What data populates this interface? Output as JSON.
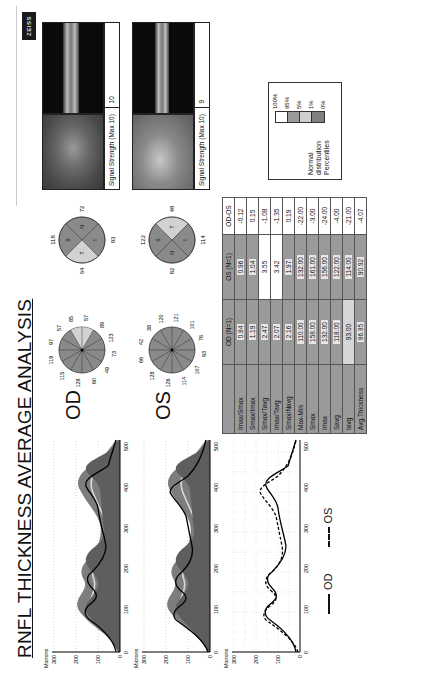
{
  "report": {
    "title": "RNFL THICKNESS AVERAGE ANALYSIS",
    "logo": "ZEISS"
  },
  "graphs": {
    "y_axis_label": "Microns",
    "y_ticks": [
      "300",
      "200",
      "100",
      "0"
    ],
    "x_ticks": [
      "0",
      "100",
      "200",
      "300",
      "400",
      "500"
    ],
    "x_regions": [
      "TEMP",
      "SUP",
      "NAS",
      "INF",
      "TEMP"
    ],
    "od_graph_title": "OD RNFL profile",
    "os_graph_title": "OS RNFL profile",
    "comparison": {
      "od_label": "OD",
      "os_label": "OS"
    }
  },
  "eyes": {
    "od": {
      "label": "OD",
      "clock_hours": [
        "97",
        "57",
        "85",
        "57",
        "89",
        "123",
        "73",
        "49",
        "60",
        "128",
        "115",
        "119"
      ],
      "quadrants": {
        "S": "118",
        "N": "72",
        "I": "93",
        "T": "64"
      },
      "signal_strength_label": "Signal Strength (Max 10)",
      "signal_strength_value": "10"
    },
    "os": {
      "label": "OS",
      "clock_hours": [
        "42",
        "38",
        "120",
        "121",
        "101",
        "76",
        "93",
        "107",
        "114",
        "126",
        "128",
        "66"
      ],
      "quadrants": {
        "S": "122",
        "T": "48",
        "I": "114",
        "N": "82"
      },
      "signal_strength_label": "Signal Strength (Max 10)",
      "signal_strength_value": "9"
    }
  },
  "table": {
    "headers": [
      "",
      "OD (N=1)",
      "OS (N=1)",
      "OD-OS"
    ],
    "rows": [
      {
        "label": "Imax/Smax",
        "od": "0.84",
        "os": "0.96",
        "diff": "-0.12"
      },
      {
        "label": "Smax/Imax",
        "od": "1.19",
        "os": "1.04",
        "diff": "0.15"
      },
      {
        "label": "Smax/Tavg",
        "od": "2.47",
        "os": "3.55",
        "diff": "-1.08"
      },
      {
        "label": "Imax/Tavg",
        "od": "2.07",
        "os": "3.42",
        "diff": "-1.35"
      },
      {
        "label": "Smax/Navg",
        "od": "2.16",
        "os": "1.97",
        "diff": "0.19"
      },
      {
        "label": "Max-Min",
        "od": "110.00",
        "os": "132.00",
        "diff": "-22.00"
      },
      {
        "label": "Smax",
        "od": "158.00",
        "os": "161.00",
        "diff": "-3.00"
      },
      {
        "label": "Imax",
        "od": "132.00",
        "os": "156.00",
        "diff": "-24.00"
      },
      {
        "label": "Savg",
        "od": "118.00",
        "os": "122.00",
        "diff": "-4.00"
      },
      {
        "label": "Iavg",
        "od": "93.00",
        "os": "114.00",
        "diff": "-21.00"
      },
      {
        "label": "Avg.Thickness",
        "od": "86.85",
        "os": "90.92",
        "diff": "-4.07"
      }
    ]
  },
  "legend": {
    "title_lines": [
      "Normal",
      "distribution",
      "Percentiles"
    ],
    "ticks": [
      "100%",
      "95%",
      "5%",
      "1%",
      "0%"
    ],
    "colors": [
      "#ffffff",
      "#9a9a9a",
      "#d0d0d0",
      "#808080"
    ]
  }
}
